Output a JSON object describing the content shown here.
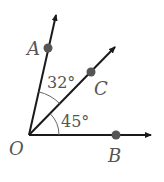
{
  "diagram": {
    "type": "angle-diagram",
    "vertex": {
      "label": "O",
      "x": 29,
      "y": 135
    },
    "rays": [
      {
        "name": "OA",
        "end": {
          "x": 56,
          "y": 14
        },
        "point": {
          "label": "A",
          "x": 48,
          "y": 48
        }
      },
      {
        "name": "OC",
        "end": {
          "x": 116,
          "y": 46
        },
        "point": {
          "label": "C",
          "x": 91,
          "y": 72
        }
      },
      {
        "name": "OB",
        "end": {
          "x": 152,
          "y": 135
        },
        "point": {
          "label": "B",
          "x": 116,
          "y": 135
        }
      }
    ],
    "angles": [
      {
        "between": "AOC",
        "label": "32°"
      },
      {
        "between": "COB",
        "label": "45°"
      }
    ],
    "colors": {
      "line": "#1a1a1a",
      "point": "#555555",
      "text": "#555555"
    }
  }
}
